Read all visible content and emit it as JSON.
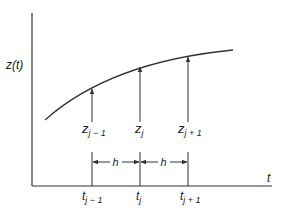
{
  "diagram": {
    "y_axis_label": "z(t)",
    "x_axis_label": "t",
    "nodes": [
      {
        "z_base": "z",
        "z_sub": "j − 1",
        "t_base": "t",
        "t_sub": "j − 1"
      },
      {
        "z_base": "z",
        "z_sub": "j",
        "t_base": "t",
        "t_sub": "j"
      },
      {
        "z_base": "z",
        "z_sub": "j + 1",
        "t_base": "t",
        "t_sub": "j + 1"
      }
    ],
    "spacing_labels": [
      "h",
      "h"
    ],
    "colors": {
      "line": "#333333",
      "background": "#ffffff"
    }
  }
}
